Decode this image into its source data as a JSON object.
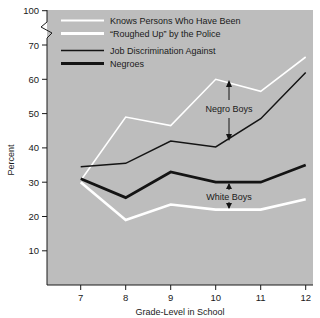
{
  "chart_data": {
    "type": "line",
    "title": "",
    "xlabel": "Grade-Level in School",
    "ylabel": "Percent",
    "categories": [
      7,
      8,
      9,
      10,
      11,
      12
    ],
    "x": [
      7,
      8,
      9,
      10,
      11,
      12
    ],
    "xlim": [
      6.6,
      12.4
    ],
    "ylim": [
      0,
      100
    ],
    "ylim_note": "axis broken between 70 and 100",
    "yticks": [
      10,
      20,
      30,
      40,
      50,
      60,
      70,
      100
    ],
    "ytick_labels": [
      "10",
      "20",
      "30",
      "40",
      "50",
      "60",
      "70",
      "100"
    ],
    "xticks": [
      7,
      8,
      9,
      10,
      11,
      12
    ],
    "xtick_labels": [
      "7",
      "8",
      "9",
      "10",
      "11",
      "12"
    ],
    "grid": false,
    "axis_break": true,
    "plot_background": "#bdbdbd",
    "legend_position": "upper-center-inside",
    "series": [
      {
        "name": "Knows Persons Who Have Been \"Roughed Up\" by the Police — Negro Boys",
        "short_name": "police-negro-boys",
        "color": "#ffffff",
        "weight": "thin",
        "values": [
          30.5,
          49.0,
          46.5,
          60.0,
          56.5,
          66.5
        ]
      },
      {
        "name": "Knows Persons Who Have Been \"Roughed Up\" by the Police — White Boys",
        "short_name": "police-white-boys",
        "color": "#ffffff",
        "weight": "thick",
        "values": [
          30.0,
          19.0,
          23.5,
          22.0,
          22.0,
          25.0
        ]
      },
      {
        "name": "Job Discrimination Against Negroes — Negro Boys",
        "short_name": "job-discrimination-negro-boys",
        "color": "#141414",
        "weight": "thin",
        "values": [
          34.5,
          35.5,
          42.0,
          40.3,
          48.5,
          62.0
        ]
      },
      {
        "name": "Job Discrimination Against Negroes — White Boys",
        "short_name": "job-discrimination-white-boys",
        "color": "#141414",
        "weight": "thick",
        "values": [
          31.0,
          25.5,
          33.0,
          30.0,
          30.0,
          35.0
        ]
      }
    ],
    "legend": [
      {
        "label": "Knows Persons Who Have Been",
        "swatch": "white-thin"
      },
      {
        "label": "“Roughed Up” by the Police",
        "swatch": "white-thick"
      },
      {
        "label": "Job Discrimination Against",
        "swatch": "black-thin"
      },
      {
        "label": "Negroes",
        "swatch": "black-thick"
      }
    ],
    "annotations": [
      {
        "text": "Negro Boys",
        "x": 10.3,
        "y_top": 60.0,
        "y_bottom": 43.0,
        "arrow": "double"
      },
      {
        "text": "White Boys",
        "x": 10.3,
        "y_top": 30.0,
        "y_bottom": 22.0,
        "arrow": "double"
      }
    ]
  }
}
